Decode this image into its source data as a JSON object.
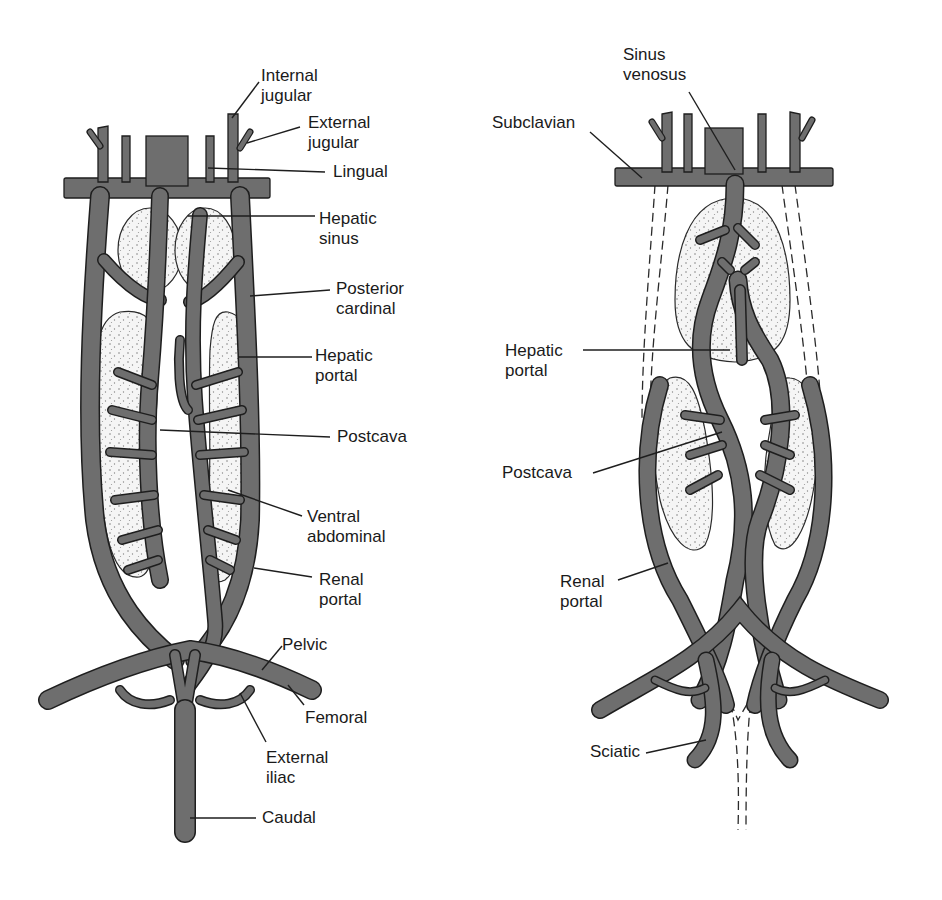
{
  "diagram_left": {
    "labels": [
      {
        "id": "internal-jugular",
        "text": "Internal\njugular",
        "x": 261,
        "y": 66
      },
      {
        "id": "external-jugular",
        "text": "External\njugular",
        "x": 308,
        "y": 113
      },
      {
        "id": "lingual",
        "text": "Lingual",
        "x": 333,
        "y": 162
      },
      {
        "id": "hepatic-sinus",
        "text": "Hepatic\nsinus",
        "x": 319,
        "y": 209
      },
      {
        "id": "posterior-cardinal",
        "text": "Posterior\ncardinal",
        "x": 336,
        "y": 279
      },
      {
        "id": "hepatic-portal",
        "text": "Hepatic\nportal",
        "x": 315,
        "y": 346
      },
      {
        "id": "postcava",
        "text": "Postcava",
        "x": 337,
        "y": 427
      },
      {
        "id": "ventral-abdominal",
        "text": "Ventral\nabdominal",
        "x": 307,
        "y": 513
      },
      {
        "id": "renal-portal",
        "text": "Renal\nportal",
        "x": 319,
        "y": 576
      },
      {
        "id": "pelvic",
        "text": "Pelvic",
        "x": 282,
        "y": 637
      },
      {
        "id": "femoral",
        "text": "Femoral",
        "x": 305,
        "y": 710
      },
      {
        "id": "external-iliac",
        "text": "External\niliac",
        "x": 266,
        "y": 748
      },
      {
        "id": "caudal",
        "text": "Caudal",
        "x": 262,
        "y": 810
      }
    ]
  },
  "diagram_right": {
    "labels": [
      {
        "id": "sinus-venosus",
        "text": "Sinus\nvenosus",
        "x": 623,
        "y": 45
      },
      {
        "id": "subclavian",
        "text": "Subclavian",
        "x": 492,
        "y": 113
      },
      {
        "id": "hepatic-portal",
        "text": "Hepatic\nportal",
        "x": 505,
        "y": 343
      },
      {
        "id": "postcava",
        "text": "Postcava",
        "x": 502,
        "y": 458
      },
      {
        "id": "renal-portal",
        "text": "Renal\nportal",
        "x": 560,
        "y": 572
      },
      {
        "id": "sciatic",
        "text": "Sciatic",
        "x": 590,
        "y": 740
      }
    ]
  }
}
